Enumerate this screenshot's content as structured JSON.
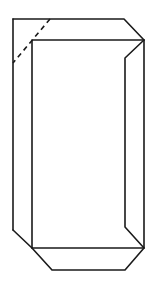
{
  "figure": {
    "title": "",
    "stroke_color": "#1a1a1a",
    "background_color": "#ffffff"
  }
}
